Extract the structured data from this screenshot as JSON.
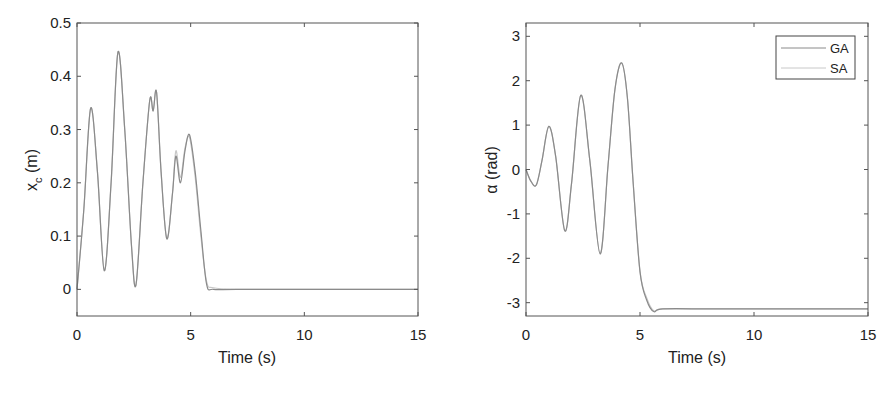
{
  "chart_data": [
    {
      "type": "line",
      "title": "",
      "xlabel": "Time (s)",
      "ylabel": "x_c (m)",
      "ylabel_main": "x",
      "ylabel_sub": "c",
      "ylabel_unit": " (m)",
      "xlim": [
        0,
        15
      ],
      "ylim": [
        -0.05,
        0.5
      ],
      "xticks": [
        0,
        5,
        10,
        15
      ],
      "xtick_labels": [
        "0",
        "5",
        "10",
        "15"
      ],
      "yticks": [
        0,
        0.1,
        0.2,
        0.3,
        0.4,
        0.5
      ],
      "ytick_labels": [
        "0",
        "0.1",
        "0.2",
        "0.3",
        "0.4",
        "0.5"
      ],
      "grid": false,
      "series": [
        {
          "name": "GA",
          "color": "#8a8a8a",
          "x": [
            0,
            0.3,
            0.6,
            0.9,
            1.2,
            1.5,
            1.8,
            2.1,
            2.4,
            2.6,
            2.9,
            3.2,
            3.35,
            3.5,
            3.7,
            3.95,
            4.2,
            4.35,
            4.55,
            4.75,
            4.95,
            5.2,
            5.45,
            5.7,
            6.0,
            7,
            10,
            15
          ],
          "y": [
            0,
            0.15,
            0.34,
            0.22,
            0.035,
            0.2,
            0.445,
            0.3,
            0.08,
            0.01,
            0.2,
            0.355,
            0.335,
            0.37,
            0.22,
            0.095,
            0.18,
            0.25,
            0.2,
            0.26,
            0.29,
            0.22,
            0.11,
            0.01,
            0.0,
            0,
            0,
            0
          ]
        },
        {
          "name": "SA",
          "color": "#c8c8c8",
          "x": [
            0,
            0.3,
            0.6,
            0.9,
            1.2,
            1.5,
            1.8,
            2.1,
            2.4,
            2.6,
            2.9,
            3.2,
            3.35,
            3.5,
            3.7,
            3.95,
            4.2,
            4.35,
            4.55,
            4.75,
            4.95,
            5.2,
            5.45,
            5.7,
            6.0,
            7,
            10,
            15
          ],
          "y": [
            0,
            0.15,
            0.34,
            0.22,
            0.035,
            0.2,
            0.445,
            0.3,
            0.08,
            0.01,
            0.2,
            0.355,
            0.335,
            0.37,
            0.22,
            0.095,
            0.18,
            0.26,
            0.21,
            0.265,
            0.285,
            0.21,
            0.1,
            0.015,
            0.003,
            0,
            0,
            0
          ]
        }
      ]
    },
    {
      "type": "line",
      "title": "",
      "xlabel": "Time (s)",
      "ylabel": "α (rad)",
      "xlim": [
        0,
        15
      ],
      "ylim": [
        -3.3,
        3.3
      ],
      "xticks": [
        0,
        5,
        10,
        15
      ],
      "xtick_labels": [
        "0",
        "5",
        "10",
        "15"
      ],
      "yticks": [
        -3,
        -2,
        -1,
        0,
        1,
        2,
        3
      ],
      "ytick_labels": [
        "-3",
        "-2",
        "-1",
        "0",
        "1",
        "2",
        "3"
      ],
      "grid": false,
      "legend": {
        "position": "northeast",
        "entries": [
          "GA",
          "SA"
        ]
      },
      "series": [
        {
          "name": "GA",
          "color": "#8a8a8a",
          "x": [
            0,
            0.2,
            0.45,
            0.7,
            1.0,
            1.3,
            1.7,
            2.0,
            2.4,
            2.8,
            3.25,
            3.6,
            3.9,
            4.2,
            4.45,
            4.7,
            5.0,
            5.3,
            5.6,
            6.0,
            8,
            10,
            15
          ],
          "y": [
            0,
            -0.25,
            -0.35,
            0.2,
            0.97,
            0.3,
            -1.38,
            -0.3,
            1.67,
            0.2,
            -1.9,
            0.1,
            1.8,
            2.4,
            1.6,
            -0.3,
            -2.3,
            -2.95,
            -3.2,
            -3.14,
            -3.14,
            -3.14,
            -3.14
          ]
        },
        {
          "name": "SA",
          "color": "#c8c8c8",
          "x": [
            0,
            0.2,
            0.45,
            0.7,
            1.0,
            1.3,
            1.7,
            2.0,
            2.4,
            2.8,
            3.25,
            3.6,
            3.9,
            4.2,
            4.45,
            4.7,
            5.0,
            5.3,
            5.6,
            6.0,
            8,
            10,
            15
          ],
          "y": [
            0,
            -0.25,
            -0.35,
            0.2,
            0.97,
            0.3,
            -1.38,
            -0.3,
            1.67,
            0.2,
            -1.9,
            0.1,
            1.8,
            2.4,
            1.6,
            -0.3,
            -2.3,
            -2.9,
            -3.18,
            -3.14,
            -3.14,
            -3.14,
            -3.14
          ]
        }
      ]
    }
  ],
  "legend": {
    "items": [
      {
        "label": "GA",
        "color": "#8a8a8a"
      },
      {
        "label": "SA",
        "color": "#c8c8c8"
      }
    ]
  }
}
